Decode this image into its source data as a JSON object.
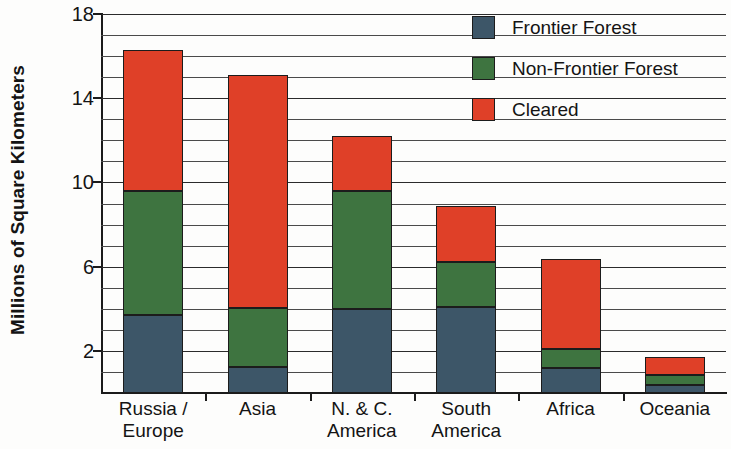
{
  "chart_data": {
    "type": "bar",
    "subtype": "stacked-vertical",
    "title": "",
    "xlabel": "",
    "ylabel": "Millions of Square Kilometers",
    "ylim": [
      0,
      18
    ],
    "ytick_step": 4,
    "ytick_labels": [
      "2",
      "6",
      "10",
      "14",
      "18"
    ],
    "ytick_values": [
      2,
      6,
      10,
      14,
      18
    ],
    "gridline_step": 1,
    "grid": true,
    "legend_position": "top-right",
    "categories": [
      "Russia / Europe",
      "Asia",
      "N. & C. America",
      "South America",
      "Africa",
      "Oceania"
    ],
    "category_label_lines": [
      [
        "Russia /",
        "Europe"
      ],
      [
        "Asia",
        ""
      ],
      [
        "N. & C.",
        "America"
      ],
      [
        "South",
        "America"
      ],
      [
        "Africa",
        ""
      ],
      [
        "Oceania",
        ""
      ]
    ],
    "series": [
      {
        "name": "Frontier Forest",
        "color": "#3d5668",
        "values": [
          3.7,
          1.25,
          4.0,
          4.1,
          1.2,
          0.4
        ]
      },
      {
        "name": "Non-Frontier Forest",
        "color": "#3e7440",
        "values": [
          5.9,
          2.8,
          5.6,
          2.1,
          0.9,
          0.45
        ]
      },
      {
        "name": "Cleared",
        "color": "#df4028",
        "values": [
          6.7,
          11.05,
          2.6,
          2.7,
          4.25,
          0.85
        ]
      }
    ],
    "totals": [
      16.3,
      15.1,
      12.2,
      8.9,
      6.35,
      1.7
    ]
  },
  "legend": {
    "items": [
      {
        "label": "Frontier Forest",
        "color": "#3d5668",
        "swatch_name": "legend-swatch-frontier-forest"
      },
      {
        "label": "Non-Frontier Forest",
        "color": "#3e7440",
        "swatch_name": "legend-swatch-non-frontier-forest"
      },
      {
        "label": "Cleared",
        "color": "#df4028",
        "swatch_name": "legend-swatch-cleared"
      }
    ]
  },
  "axes": {
    "y_title": "Millions of Square Kilometers"
  }
}
